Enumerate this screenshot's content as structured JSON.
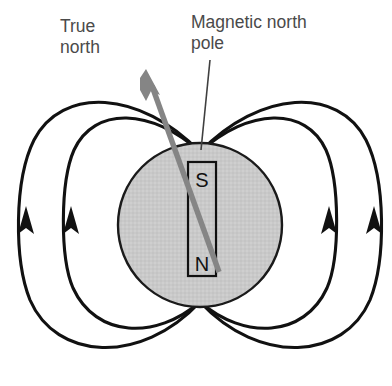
{
  "figure": {
    "background_color": "#ffffff"
  },
  "labels": {
    "true_north": "True\nnorth",
    "magnetic_north_pole": "Magnetic north\npole",
    "text_color": "#4a4a4a"
  },
  "earth": {
    "name": "earth-sphere",
    "center_x": 200,
    "center_y": 225,
    "radius": 82,
    "fill_color": "#c9c9c9",
    "stroke_color": "#1a1a1a"
  },
  "bar_magnet": {
    "name": "bar-magnet",
    "x": 188,
    "y": 162,
    "width": 28,
    "height": 114,
    "fill_color": "#c9c9c9",
    "stroke_color": "#111111",
    "south_label": "S",
    "north_label": "N"
  },
  "true_north_arrow": {
    "name": "true-north-arrow",
    "color": "#808080",
    "tail_x": 219,
    "tail_y": 272,
    "tip_x": 147,
    "tip_y": 72
  },
  "leader_line": {
    "name": "magnetic-pole-leader-line",
    "color": "#3a3a3a",
    "x1": 209,
    "y1": 60,
    "x2": 201,
    "y2": 150
  },
  "field_lines": {
    "stroke_color": "#111111",
    "arrow_direction": "upward",
    "loops": [
      {
        "name": "field-loop-left-outer",
        "side": "left",
        "index": 1
      },
      {
        "name": "field-loop-left-inner",
        "side": "left",
        "index": 2
      },
      {
        "name": "field-loop-right-inner",
        "side": "right",
        "index": 1
      },
      {
        "name": "field-loop-right-outer",
        "side": "right",
        "index": 2
      }
    ],
    "arrowheads": [
      {
        "name": "field-arrowhead-left-outer",
        "x": 28,
        "y": 228
      },
      {
        "name": "field-arrowhead-left-inner",
        "x": 73,
        "y": 228
      },
      {
        "name": "field-arrowhead-right-inner",
        "x": 328,
        "y": 228
      },
      {
        "name": "field-arrowhead-right-outer",
        "x": 373,
        "y": 228
      }
    ]
  }
}
